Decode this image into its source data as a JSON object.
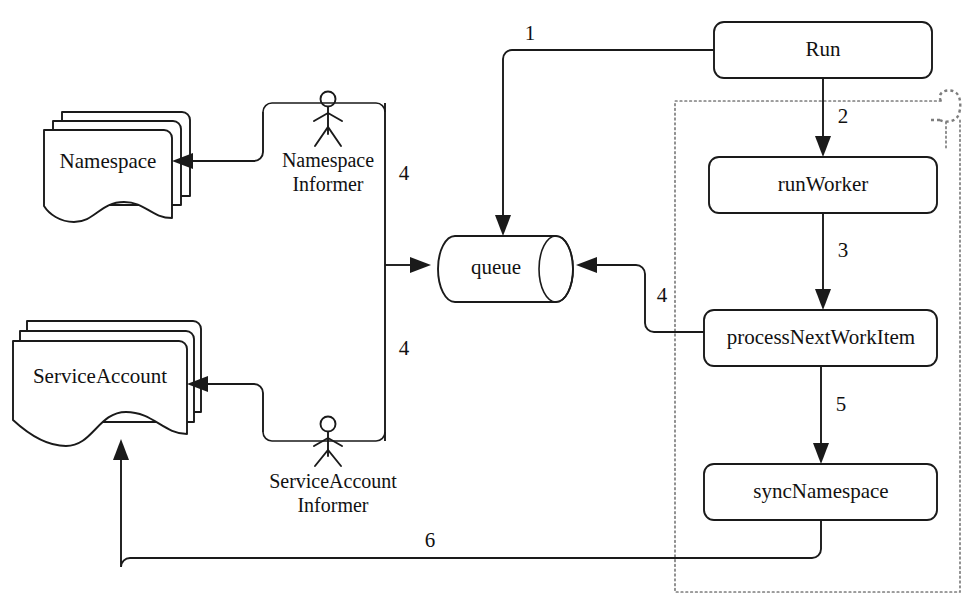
{
  "diagram": {
    "type": "flow-diagram",
    "colors": {
      "stroke": "#1a1a1a",
      "boundary": "#7d7d7d",
      "background": "#ffffff"
    },
    "process_nodes": [
      {
        "id": "run",
        "label": "Run"
      },
      {
        "id": "run-worker",
        "label": "runWorker"
      },
      {
        "id": "process-next-work-item",
        "label": "processNextWorkItem"
      },
      {
        "id": "sync-namespace",
        "label": "syncNamespace"
      }
    ],
    "queue_node": {
      "id": "queue",
      "label": "queue"
    },
    "document_nodes": [
      {
        "id": "namespace",
        "label": "Namespace"
      },
      {
        "id": "service-account",
        "label": "ServiceAccount"
      }
    ],
    "actors": [
      {
        "id": "namespace-informer",
        "line1": "Namespace",
        "line2": "Informer"
      },
      {
        "id": "service-account-informer",
        "line1": "ServiceAccount",
        "line2": "Informer"
      }
    ],
    "edge_labels": [
      {
        "id": "edge-1",
        "label": "1"
      },
      {
        "id": "edge-2",
        "label": "2"
      },
      {
        "id": "edge-3",
        "label": "3"
      },
      {
        "id": "edge-4-top",
        "label": "4"
      },
      {
        "id": "edge-4-bottom",
        "label": "4"
      },
      {
        "id": "edge-5",
        "label": "5"
      },
      {
        "id": "edge-6",
        "label": "6"
      },
      {
        "id": "edge-7",
        "label": "7"
      }
    ]
  }
}
